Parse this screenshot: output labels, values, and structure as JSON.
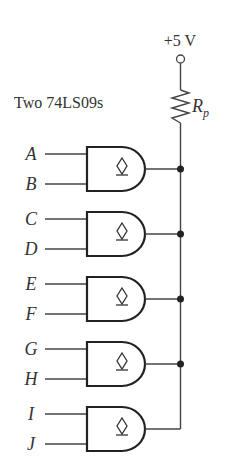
{
  "diagram": {
    "type": "wired-AND open-collector circuit",
    "supply_label": "+5 V",
    "chip_label": "Two 74LS09s",
    "resistor": {
      "label": "R",
      "subscript": "p"
    },
    "gate_symbol": "open-collector-diamond",
    "gates": [
      {
        "inputs": [
          "A",
          "B"
        ]
      },
      {
        "inputs": [
          "C",
          "D"
        ]
      },
      {
        "inputs": [
          "E",
          "F"
        ]
      },
      {
        "inputs": [
          "G",
          "H"
        ]
      },
      {
        "inputs": [
          "I",
          "J"
        ]
      }
    ]
  }
}
